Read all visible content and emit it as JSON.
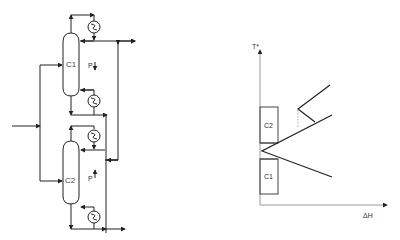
{
  "flowsheet": {
    "columns": [
      {
        "id": "C1",
        "label": "C1",
        "pressure_label": "P",
        "pressure_direction": "down"
      },
      {
        "id": "C2",
        "label": "C2",
        "pressure_label": "P",
        "pressure_direction": "up"
      }
    ]
  },
  "chart": {
    "y_axis_label": "T*",
    "x_axis_label": "ΔH",
    "boxes": [
      {
        "label": "C2"
      },
      {
        "label": "C1"
      }
    ]
  },
  "colors": {
    "line": "#222222",
    "dashed": "#aaaaaa",
    "box": "#444444"
  }
}
